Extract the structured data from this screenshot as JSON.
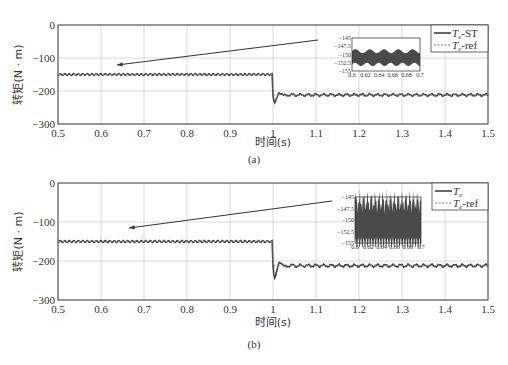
{
  "chart_data": [
    {
      "type": "line",
      "panel": "(a)",
      "xlabel": "时间(s)",
      "ylabel": "转矩(N·m)",
      "xlim": [
        0.5,
        1.5
      ],
      "ylim": [
        -300,
        0
      ],
      "xticks": [
        "0.5",
        "0.6",
        "0.7",
        "0.8",
        "0.9",
        "1",
        "1.1",
        "1.2",
        "1.3",
        "1.4",
        "1.5"
      ],
      "yticks": [
        "0",
        "-100",
        "-200",
        "-300"
      ],
      "grid": true,
      "legend_position": "upper right",
      "series": [
        {
          "name": "Te-ST",
          "style": "solid",
          "x": [
            0.5,
            1.0,
            1.01,
            1.02,
            1.03,
            1.05,
            1.5
          ],
          "values": [
            -150,
            -150,
            -245,
            -180,
            -225,
            -212,
            -212
          ]
        },
        {
          "name": "Te-ref",
          "style": "dotted",
          "x": [
            0.5,
            1.0,
            1.0,
            1.5
          ],
          "values": [
            -150,
            -150,
            -212,
            -212
          ]
        }
      ],
      "inset": {
        "xlim": [
          0.6,
          0.7
        ],
        "ylim": [
          -155,
          -145
        ],
        "xticks": [
          "0.6",
          "0.62",
          "0.64",
          "0.66",
          "0.68",
          "0.7"
        ],
        "yticks": [
          "-145",
          "-147.5",
          "-150",
          "-152.5",
          "-155"
        ],
        "band": [
          -153,
          -149
        ]
      }
    },
    {
      "type": "line",
      "panel": "(b)",
      "xlabel": "时间(s)",
      "ylabel": "转矩(N·m)",
      "xlim": [
        0.5,
        1.5
      ],
      "ylim": [
        -300,
        0
      ],
      "xticks": [
        "0.5",
        "0.6",
        "0.7",
        "0.8",
        "0.9",
        "1",
        "1.1",
        "1.2",
        "1.3",
        "1.4",
        "1.5"
      ],
      "yticks": [
        "0",
        "-100",
        "-200",
        "-300"
      ],
      "grid": true,
      "legend_position": "upper right",
      "series": [
        {
          "name": "Te",
          "style": "solid",
          "x": [
            0.5,
            1.0,
            1.01,
            1.02,
            1.03,
            1.05,
            1.5
          ],
          "values": [
            -150,
            -150,
            -260,
            -190,
            -230,
            -212,
            -212
          ]
        },
        {
          "name": "Te-ref",
          "style": "dotted",
          "x": [
            0.5,
            1.0,
            1.0,
            1.5
          ],
          "values": [
            -150,
            -150,
            -212,
            -212
          ]
        }
      ],
      "inset": {
        "xlim": [
          0.6,
          0.7
        ],
        "ylim": [
          -155,
          -145
        ],
        "xticks": [
          "0.6",
          "0.62",
          "0.64",
          "0.66",
          "0.68",
          "0.7"
        ],
        "yticks": [
          "-145",
          "-147.5",
          "-150",
          "-152.5",
          "-155"
        ],
        "band": [
          -155,
          -146
        ]
      }
    }
  ],
  "labels": {
    "xlabel": "时间(s)",
    "ylabel": "转矩(N · m)",
    "caption_a": "(a)",
    "caption_b": "(b)",
    "legend_a": [
      "-ST",
      "-ref"
    ],
    "legend_b": [
      "",
      "-ref"
    ],
    "legend_var": "T",
    "legend_sub": "e"
  }
}
